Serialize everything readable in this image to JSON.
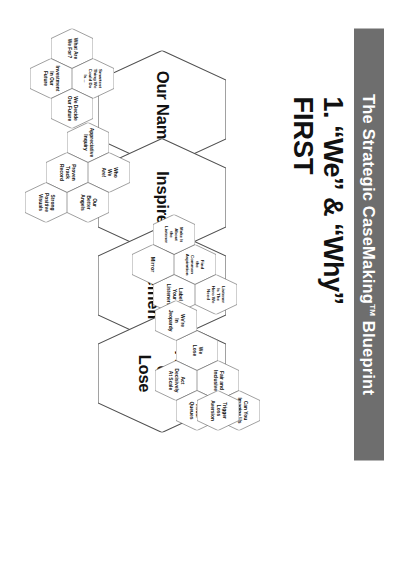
{
  "title_bar": {
    "text_before": "The Strategic CaseMaking",
    "tm": "TM",
    "text_after": " Blueprint",
    "full": "The Strategic CaseMaking™ Blueprint",
    "background_color": "#6e6e6e",
    "text_color": "#ffffff"
  },
  "heading": {
    "line1": "1. “We” & “Why”",
    "line2": "FIRST",
    "color": "#111111"
  },
  "diagram": {
    "type": "hexagon-cluster-map",
    "outline_color": "#4f4f4f",
    "fill_color": "#ffffff",
    "big_hexagons": [
      {
        "id": "our-name",
        "label": "Our Name"
      },
      {
        "id": "inspire",
        "label": "Inspire"
      },
      {
        "id": "we-why-statement",
        "label": "WE / WHY\nStatement"
      },
      {
        "id": "adapt-or-lose",
        "label": "Adapt\nor\nLose"
      }
    ],
    "clusters": [
      {
        "id": "our-name-cluster",
        "parent": "our-name",
        "cells": [
          "What Are\nWe For?",
          "Smartest\nThing We\nCould Do\nIs…",
          "Investment\nIn Our\nFuture",
          "We Decide\nOur Future"
        ]
      },
      {
        "id": "inspire-cluster",
        "parent": "inspire",
        "cells": [
          "Appreciative\nInquiry",
          "Who\nWe\nAre!",
          "Proven\nTrack\nRecord",
          "Our\nBetter\nAngels",
          "Strong\nPositive\nVisuals"
        ]
      },
      {
        "id": "we-why-cluster",
        "parent": "we-why-statement",
        "cells": [
          "Find\nthe\nCommon\nAspiration",
          "Make It\nAbout\nthe\nListener",
          "Listener\nIs The\nHero We\nNeed",
          "Label\nYour\nListeners",
          "Mirror"
        ]
      },
      {
        "id": "adapt-or-lose-cluster",
        "parent": "adapt-or-lose",
        "cells": [
          "We\nLose",
          "We're\nIn\nJeopardy",
          "Fair and\nInclusive",
          "Act\nDecisively\nAt Scale",
          "Can You\nImagine Us\nWithout…",
          "Strong\nVisual\nQueues",
          "Trigger\nLoss\nAversion"
        ]
      }
    ]
  }
}
